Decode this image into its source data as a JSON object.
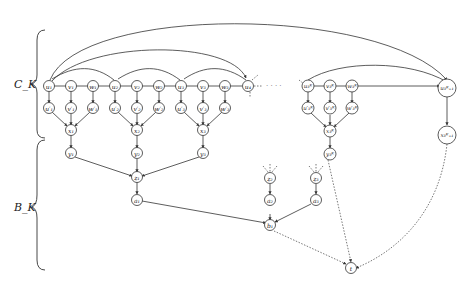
{
  "labels": {
    "top_group": "C_K",
    "bottom_group": "B_K",
    "ellipsis": "· · · ·"
  },
  "nodes": {
    "u1": "u₁",
    "v1": "v₁",
    "w1": "w₁",
    "u2": "u₂",
    "v2": "v₂",
    "w2": "w₂",
    "u3": "u₃",
    "v3": "v₃",
    "w3": "w₃",
    "u4": "u₄",
    "u1p": "u′₁",
    "v1p": "v′₁",
    "w1p": "w′₁",
    "u2p": "u′₂",
    "v2p": "v′₂",
    "w2p": "w′₂",
    "u3p": "u′₃",
    "v3p": "v′₃",
    "w3p": "w′₃",
    "x1": "x₁",
    "x2": "x₂",
    "x3": "x₃",
    "y1": "y₁",
    "y2": "y₂",
    "y3": "y₃",
    "z1": "z₁",
    "a1": "a₁",
    "z2": "z₂",
    "z3": "z₃",
    "a2": "a₂",
    "a3": "a₃",
    "b1": "b₁",
    "t": "t",
    "u3K": "u₃ᴷ",
    "v3K": "v₃ᴷ",
    "w3K": "w₃ᴷ",
    "u3Kp": "u′₃ᴷ",
    "v3Kp": "v′₃ᴷ",
    "w3Kp": "w′₃ᴷ",
    "x3K": "x₃ᴷ",
    "y3K": "y₃ᴷ",
    "u3K1": "u₃ᴷ₊₁",
    "x3K1": "x₃ᴷ₊₁"
  }
}
